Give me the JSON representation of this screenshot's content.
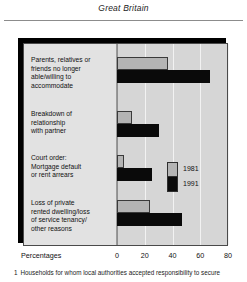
{
  "header": {
    "region_title": "Great Britain"
  },
  "footnote": {
    "marker": "1",
    "text": "Households for whom local authorities accepted responsibility to secure"
  },
  "axis": {
    "title": "Percentages",
    "ticks": [
      "0",
      "20",
      "40",
      "60",
      "80"
    ]
  },
  "legend": {
    "items": [
      {
        "label": "1981",
        "color": "#b4b4b4"
      },
      {
        "label": "1991",
        "color": "#0a0a0a"
      }
    ]
  },
  "chart_data": {
    "type": "bar",
    "orientation": "horizontal",
    "title": "Great Britain",
    "xlabel": "Percentages",
    "ylabel": "",
    "xlim": [
      0,
      80
    ],
    "xticks": [
      0,
      20,
      40,
      60,
      80
    ],
    "grid": true,
    "legend_position": "inside-right",
    "categories": [
      "Parents, relatives or friends no longer able/willing to accommodate",
      "Breakdown of relationship with partner",
      "Court order: Mortgage default or rent arrears",
      "Loss of private rented dwelling/loss of service tenancy/ other reasons"
    ],
    "category_lines": [
      [
        "Parents, relatives or",
        "friends no longer",
        "able/willing to",
        "accommodate"
      ],
      [
        "Breakdown of",
        "relationship",
        "with partner"
      ],
      [
        "Court order:",
        "Mortgage default",
        "or rent arrears"
      ],
      [
        "Loss of private",
        "rented dwelling/loss",
        "of service tenancy/",
        "other reasons"
      ]
    ],
    "series": [
      {
        "name": "1981",
        "color": "#b4b4b4",
        "values": [
          37,
          11,
          5,
          24
        ]
      },
      {
        "name": "1991",
        "color": "#0a0a0a",
        "values": [
          67,
          30,
          25,
          47
        ]
      }
    ]
  }
}
